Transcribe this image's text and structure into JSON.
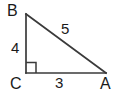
{
  "diagram": {
    "type": "right-triangle",
    "background_color": "#ffffff",
    "stroke_color": "#3a3a3a",
    "text_color": "#1a1a1a",
    "stroke_width": 1.6,
    "vertices": [
      {
        "name": "B",
        "label": "B",
        "x": 26,
        "y": 14
      },
      {
        "name": "C",
        "label": "C",
        "x": 26,
        "y": 73
      },
      {
        "name": "A",
        "label": "A",
        "x": 106,
        "y": 73
      }
    ],
    "sides": [
      {
        "name": "leg-vertical-bc",
        "label": "4",
        "from": "B",
        "to": "C",
        "length": 4
      },
      {
        "name": "leg-horizontal-ca",
        "label": "3",
        "from": "C",
        "to": "A",
        "length": 3
      },
      {
        "name": "hypotenuse-ab",
        "label": "5",
        "from": "A",
        "to": "B",
        "length": 5
      }
    ],
    "right_angle": {
      "at_vertex": "C",
      "marker": "square",
      "size": 10
    }
  }
}
